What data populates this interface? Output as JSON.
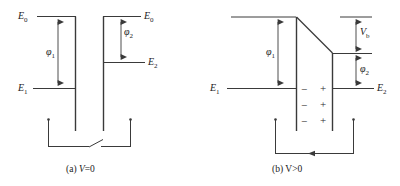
{
  "figure": {
    "kind": "energy-band-diagram",
    "line_color": "#3a3a3a",
    "text_color": "#1a1a1a",
    "background": "#ffffff"
  },
  "panel_a": {
    "caption": "(a) V=0",
    "caption_prefix": "(a) ",
    "caption_var": "V",
    "caption_rest": "=0",
    "labels": {
      "e0_left": "E",
      "e0_left_sub": "0",
      "e1": "E",
      "e1_sub": "1",
      "e0_right": "E",
      "e0_right_sub": "0",
      "e2": "E",
      "e2_sub": "2",
      "phi1": "φ",
      "phi1_sub": "1",
      "phi2": "φ",
      "phi2_sub": "2"
    },
    "switch_state": "open"
  },
  "panel_b": {
    "caption": "(b) V>0",
    "caption_prefix": "(b) ",
    "caption_var": "V",
    "caption_rest": ">0",
    "labels": {
      "e1": "E",
      "e1_sub": "1",
      "e2": "E",
      "e2_sub": "2",
      "phi1": "φ",
      "phi1_sub": "1",
      "phi2": "φ",
      "phi2_sub": "2",
      "vb": "V",
      "vb_sub": "b"
    },
    "charges_negative": [
      "−",
      "−",
      "−"
    ],
    "charges_positive": [
      "+",
      "+",
      "+"
    ],
    "switch_state": "closed",
    "current_direction": "leftward"
  }
}
